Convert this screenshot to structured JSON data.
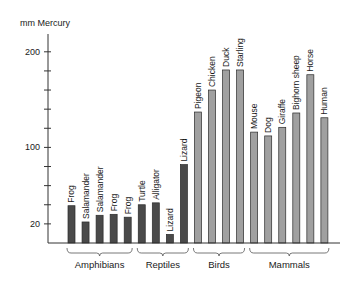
{
  "chart_data": {
    "type": "bar",
    "title": "",
    "xlabel": "",
    "ylabel": "mm Mercury",
    "ylim": [
      0,
      220
    ],
    "yticks_labeled": [
      20,
      100,
      200
    ],
    "ytick_step": 20,
    "grid": false,
    "legend": null,
    "categories": [
      "Frog",
      "Salamander",
      "Salamander",
      "Frog",
      "Frog",
      "Turtle",
      "Alligator",
      "Lizard",
      "Lizard",
      "Pigeon",
      "Chicken",
      "Duck",
      "Starling",
      "Mouse",
      "Dog",
      "Giraffe",
      "Bighorn sheep",
      "Horse",
      "Human"
    ],
    "values": [
      39,
      22,
      29,
      30,
      27,
      40,
      42,
      9,
      82,
      137,
      160,
      181,
      181,
      116,
      112,
      121,
      136,
      176,
      131
    ],
    "groups": [
      {
        "name": "Amphibians",
        "start": 0,
        "end": 4,
        "color": "#4a4a4a"
      },
      {
        "name": "Reptiles",
        "start": 5,
        "end": 8,
        "color": "#4a4a4a"
      },
      {
        "name": "Birds",
        "start": 9,
        "end": 12,
        "color": "#a0a0a0"
      },
      {
        "name": "Mammals",
        "start": 13,
        "end": 18,
        "color": "#a0a0a0"
      }
    ]
  },
  "colors": {
    "dark_bar": "#4a4a4a",
    "light_bar": "#a0a0a0",
    "outline": "#2a2a2a",
    "axis": "#333333",
    "text": "#1a1a1a"
  }
}
